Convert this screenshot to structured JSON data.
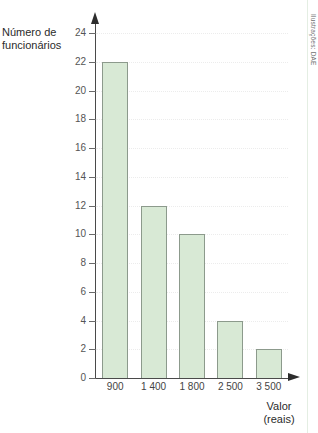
{
  "chart_data": {
    "type": "bar",
    "title": "",
    "categories": [
      "900",
      "1 400",
      "1 800",
      "2 500",
      "3 500"
    ],
    "values": [
      22,
      12,
      10,
      4,
      2
    ],
    "xlabel": "Valor (reais)",
    "ylabel": "Número de funcionários",
    "ylim": [
      0,
      24
    ],
    "ytick_step": 2,
    "yticks": [
      0,
      2,
      4,
      6,
      8,
      10,
      12,
      14,
      16,
      18,
      20,
      22,
      24
    ],
    "ytick_labels": [
      "0",
      "2",
      "4",
      "6",
      "8",
      "10",
      "12",
      "14",
      "16",
      "18",
      "20",
      "22",
      "24"
    ],
    "grid": true,
    "grid_axis": "y",
    "legend": false,
    "bar_color": "#d8e9d5",
    "bar_border_color": "#8c9a8c",
    "axis_color": "#4a4a4a",
    "gridline_color": "#ececec"
  },
  "axes": {
    "y_title_line1": "Número de",
    "y_title_line2": "funcionários",
    "x_title_line1": "Valor",
    "x_title_line2": "(reais)"
  },
  "credit": {
    "text": "Ilustrações: DAE"
  }
}
